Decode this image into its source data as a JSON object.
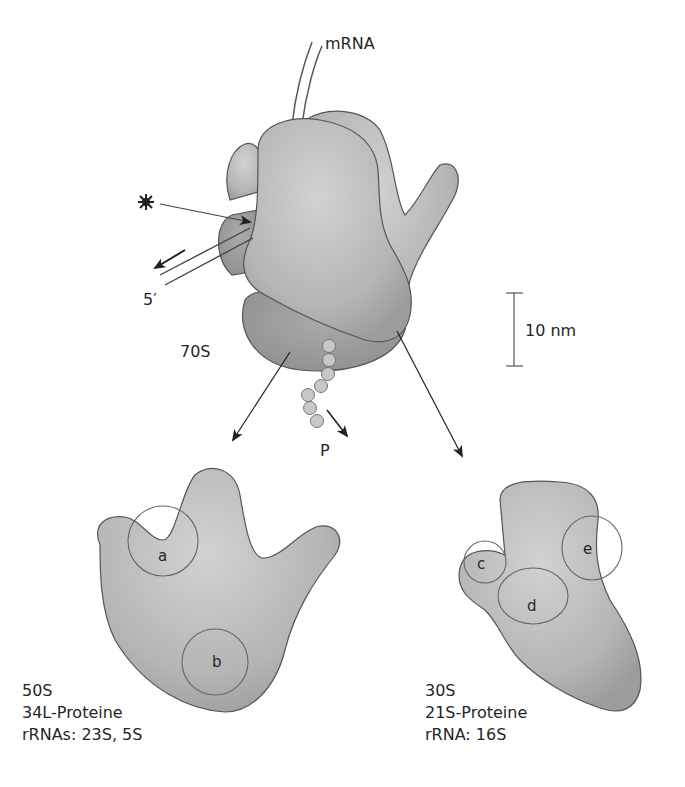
{
  "figure": {
    "ribosome_70s": {
      "label": "70S",
      "mrna_label": "mRNA",
      "five_prime_label": "5′",
      "peptide_label": "P",
      "star_icon": "burst-star"
    },
    "scale_bar": {
      "label": "10 nm"
    },
    "subunit_50s": {
      "sites": [
        "a",
        "b"
      ],
      "caption": [
        "50S",
        "34L-Proteine",
        "rRNAs: 23S, 5S"
      ]
    },
    "subunit_30s": {
      "sites": [
        "c",
        "d",
        "e"
      ],
      "caption": [
        "30S",
        "21S-Proteine",
        "rRNA: 16S"
      ]
    },
    "colors": {
      "body_fill": "#b4b4b4",
      "body_dark": "#999999",
      "outline": "#555555",
      "bead_fill": "#c8c8c8"
    }
  }
}
